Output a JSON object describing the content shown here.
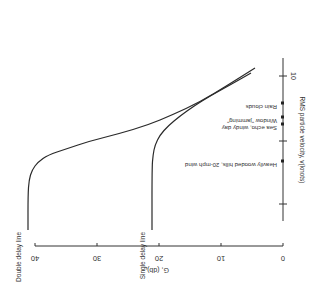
{
  "chart_data": {
    "type": "line",
    "orientation_note": "figure printed rotated 90 degrees clockwise",
    "title": "",
    "xlabel": "RMS particle velocity, v(knots)",
    "ylabel": "G, (db)",
    "x_ticks": [
      {
        "label": "10",
        "pos": 76
      },
      {
        "label": "",
        "pos": 141
      },
      {
        "label": "",
        "pos": 204
      }
    ],
    "y_ticks": [
      {
        "value": 40,
        "label": "40"
      },
      {
        "value": 30,
        "label": "30"
      },
      {
        "value": 20,
        "label": "20"
      },
      {
        "value": 10,
        "label": "10"
      },
      {
        "value": 0,
        "label": "0"
      }
    ],
    "ylim": [
      0,
      40
    ],
    "grid": false,
    "series": [
      {
        "name": "Double delay line",
        "points_px": [
          [
            255,
            68
          ],
          [
            228,
            85
          ],
          [
            200,
            102
          ],
          [
            172,
            115
          ],
          [
            148,
            125
          ],
          [
            118,
            134
          ],
          [
            90,
            141
          ],
          [
            66,
            149
          ],
          [
            48,
            155
          ],
          [
            38,
            162
          ],
          [
            32,
            170
          ],
          [
            29,
            180
          ],
          [
            28,
            195
          ],
          [
            28,
            230
          ]
        ],
        "approx_values_db": {
          "at_tick_10": 5,
          "plateau": 41
        }
      },
      {
        "name": "Single delay line",
        "points_px": [
          [
            251,
            73
          ],
          [
            230,
            85
          ],
          [
            210,
            96
          ],
          [
            194,
            106
          ],
          [
            180,
            116
          ],
          [
            168,
            126
          ],
          [
            160,
            135
          ],
          [
            155,
            145
          ],
          [
            153,
            155
          ],
          [
            152,
            168
          ],
          [
            152,
            230
          ]
        ],
        "approx_values_db": {
          "at_tick_10": 5.5,
          "plateau": 22.5
        }
      }
    ],
    "markers": [
      {
        "label": "Rain clouds",
        "pos": 103
      },
      {
        "label": "Window \"jamming\"",
        "pos": 117
      },
      {
        "label": "Sea echo, windy day",
        "pos": 124
      },
      {
        "label": "Heavily wooded hills, 20-mph wind",
        "pos": 161
      }
    ],
    "legend": "curve labels placed inline along plateau ends"
  }
}
